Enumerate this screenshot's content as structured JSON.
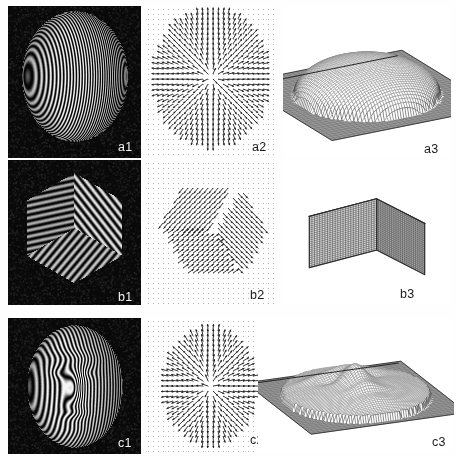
{
  "figure": {
    "width": 456,
    "height": 456,
    "background": "#ffffff",
    "grid": {
      "rows": 3,
      "columns": 3
    },
    "column_kinds": [
      "fringe-photograph",
      "gradient-vector-field",
      "reconstructed-3d-mesh"
    ],
    "row_objects": [
      "sphere",
      "cube",
      "face"
    ]
  },
  "colors": {
    "photo_background": "#090909",
    "fringe_bright": "#f0f0f0",
    "fringe_dark": "#0a0a0a",
    "quiver_background": "#ffffff",
    "quiver_ink": "#202020",
    "quiver_dot": "#b4b4b4",
    "mesh_line": "#4a4a4a",
    "mesh_base": "#9a9a9a",
    "label_light": "#f2f2f2",
    "label_dark": "#1a1a1a"
  },
  "panels": [
    {
      "id": "a1",
      "label": "a1",
      "label_style": "light",
      "kind": "fringe-photograph",
      "object": "sphere",
      "x": 8,
      "y": 6,
      "w": 133,
      "h": 152,
      "label_x": 118,
      "label_y": 141,
      "render": {
        "type": "fringe-photo",
        "shape": "sphere",
        "cx": 0.5,
        "cy": 0.46,
        "rx": 0.4,
        "ry": 0.43,
        "fringe_count": 44,
        "fringe_orientation": "vertical-curved",
        "curvature": 0.95,
        "shading": "radial-specular"
      }
    },
    {
      "id": "a2",
      "label": "a2",
      "label_style": "dark",
      "kind": "gradient-vector-field",
      "object": "sphere",
      "x": 145,
      "y": 6,
      "w": 133,
      "h": 152,
      "label_x": 252,
      "label_y": 141,
      "render": {
        "type": "quiver",
        "field": "radial",
        "mask": "ellipse",
        "grid_spacing": 5,
        "mask_cx": 0.5,
        "mask_cy": 0.47,
        "mask_rx": 0.42,
        "mask_ry": 0.44,
        "arrow_length": 6.5,
        "show_background_dots": true
      }
    },
    {
      "id": "a3",
      "label": "a3",
      "label_style": "dark",
      "kind": "reconstructed-3d-mesh",
      "object": "sphere",
      "x": 283,
      "y": 6,
      "w": 168,
      "h": 152,
      "label_x": 424,
      "label_y": 143,
      "render": {
        "type": "mesh3d",
        "surface": "dome",
        "grid_n": 56,
        "base_plate": true,
        "dome_height": 0.6,
        "dome_radius": 0.78,
        "yaw": -0.52,
        "pitch": 0.5
      }
    },
    {
      "id": "b1",
      "label": "b1",
      "label_style": "light",
      "kind": "fringe-photograph",
      "object": "cube",
      "x": 8,
      "y": 160,
      "w": 133,
      "h": 145,
      "label_x": 118,
      "label_y": 291,
      "render": {
        "type": "fringe-photo",
        "shape": "cube",
        "fringe_count": 22,
        "faces": [
          {
            "name": "top",
            "fringe_angle": -38
          },
          {
            "name": "left",
            "fringe_angle": 78
          },
          {
            "name": "right",
            "fringe_angle": 40
          }
        ]
      }
    },
    {
      "id": "b2",
      "label": "b2",
      "label_style": "dark",
      "kind": "gradient-vector-field",
      "object": "cube",
      "x": 145,
      "y": 160,
      "w": 133,
      "h": 145,
      "label_x": 250,
      "label_y": 289,
      "render": {
        "type": "quiver",
        "field": "cube-faces",
        "mask": "hexagon",
        "grid_spacing": 5,
        "arrow_length": 7,
        "face_angles": [
          128,
          48,
          -34
        ],
        "seam_gap": true,
        "show_background_dots": true
      }
    },
    {
      "id": "b3",
      "label": "b3",
      "label_style": "dark",
      "kind": "reconstructed-3d-mesh",
      "object": "cube",
      "x": 283,
      "y": 160,
      "w": 168,
      "h": 145,
      "label_x": 400,
      "label_y": 288,
      "render": {
        "type": "mesh3d",
        "surface": "cube",
        "grid_n": 26,
        "base_plate": false,
        "yaw": -0.62,
        "pitch": 0.42
      }
    },
    {
      "id": "c1",
      "label": "c1",
      "label_style": "light",
      "kind": "fringe-photograph",
      "object": "face",
      "x": 8,
      "y": 318,
      "w": 133,
      "h": 136,
      "label_x": 118,
      "label_y": 437,
      "render": {
        "type": "fringe-photo",
        "shape": "face",
        "fringe_count": 34,
        "fringe_orientation": "vertical-deformed",
        "profile_amplitude": 0.3
      }
    },
    {
      "id": "c2",
      "label": "c2",
      "label_style": "dark",
      "kind": "gradient-vector-field",
      "object": "face",
      "x": 145,
      "y": 318,
      "w": 133,
      "h": 136,
      "label_x": 250,
      "label_y": 434,
      "render": {
        "type": "quiver",
        "field": "face",
        "mask": "face-oval",
        "grid_spacing": 5,
        "arrow_length": 7,
        "show_background_dots": true
      }
    },
    {
      "id": "c3",
      "label": "c3",
      "label_style": "dark",
      "kind": "reconstructed-3d-mesh",
      "object": "face",
      "x": 258,
      "y": 318,
      "w": 196,
      "h": 136,
      "label_x": 432,
      "label_y": 436,
      "render": {
        "type": "mesh3d",
        "surface": "face",
        "grid_n": 62,
        "base_plate": true,
        "yaw": -0.4,
        "pitch": 0.6
      }
    }
  ]
}
